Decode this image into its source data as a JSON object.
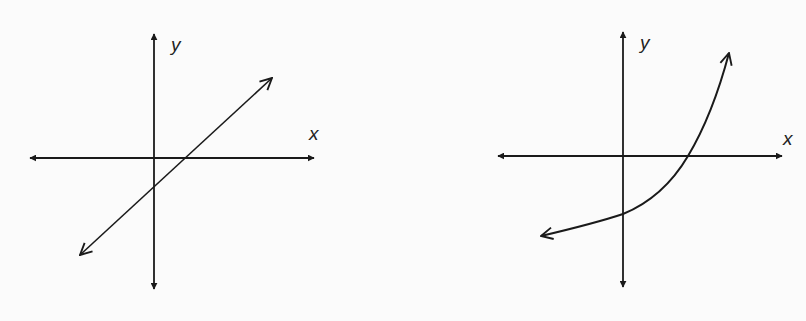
{
  "figure": {
    "background": "#fbfbfb",
    "stroke_color": "#1a1a1a",
    "graphs": [
      {
        "id": "linear",
        "description": "Straight line with positive slope; crosses y-axis below origin and x-axis right of origin",
        "x_label": "x",
        "y_label": "y",
        "function_type": "linear"
      },
      {
        "id": "exponential",
        "description": "Increasing concave-up curve; crosses y-axis below origin, crosses x-axis right of origin, rising steeply to upper right",
        "x_label": "x",
        "y_label": "y",
        "function_type": "exponential"
      }
    ]
  }
}
